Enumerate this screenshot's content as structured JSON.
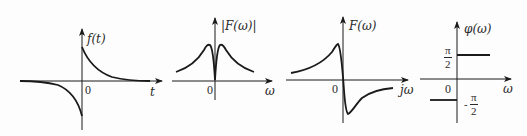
{
  "figure": {
    "panels": [
      {
        "id": "time-signal",
        "y_label": "f(t)",
        "x_label": "t",
        "origin_label": "0",
        "description": "odd exponential signal: positive decaying for t>0, negative for t<0"
      },
      {
        "id": "magnitude-spectrum",
        "y_label": "|F(ω)|",
        "x_label": "ω",
        "origin_label": "0",
        "description": "even magnitude spectrum with two peaks and zero at ω=0"
      },
      {
        "id": "spectrum",
        "y_label": "F(ω)",
        "x_label": "jω",
        "origin_label": "0",
        "description": "odd imaginary spectrum: positive peak just left of 0, negative trough just right of 0"
      },
      {
        "id": "phase-spectrum",
        "y_label": "φ(ω)",
        "x_label": "ω",
        "origin_label": "0",
        "upper_level": {
          "numerator": "π",
          "denominator": "2",
          "sign": ""
        },
        "lower_level": {
          "numerator": "π",
          "denominator": "2",
          "sign": "-"
        },
        "description": "phase is +π/2 for ω>0 and -π/2 for ω<0"
      }
    ],
    "colors": {
      "stroke": "#1a1a1a",
      "background": "#fdfdfd"
    }
  }
}
